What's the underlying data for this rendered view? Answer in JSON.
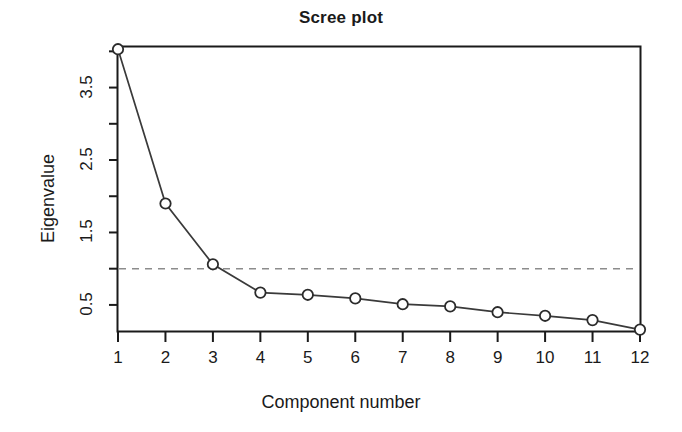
{
  "chart_data": {
    "type": "line",
    "title": "Scree plot",
    "xlabel": "Component number",
    "ylabel": "Eigenvalue",
    "categories": [
      1,
      2,
      3,
      4,
      5,
      6,
      7,
      8,
      9,
      10,
      11,
      12
    ],
    "x_tick_labels": [
      "1",
      "2",
      "3",
      "4",
      "5",
      "6",
      "7",
      "8",
      "9",
      "10",
      "11",
      "12"
    ],
    "values": [
      4.03,
      1.9,
      1.06,
      0.67,
      0.64,
      0.59,
      0.51,
      0.48,
      0.4,
      0.35,
      0.29,
      0.16
    ],
    "series": [
      {
        "name": "Eigenvalue",
        "values": [
          4.03,
          1.9,
          1.06,
          0.67,
          0.64,
          0.59,
          0.51,
          0.48,
          0.4,
          0.35,
          0.29,
          0.16
        ]
      }
    ],
    "y_tick_labels": [
      "0.5",
      "1.5",
      "2.5",
      "3.5"
    ],
    "y_tick_values": [
      0.5,
      1.5,
      2.5,
      3.5
    ],
    "y_minor_tick_values": [
      1.0,
      2.0,
      3.0,
      4.0
    ],
    "ylim": [
      0.14,
      4.06
    ],
    "xlim": [
      1,
      12
    ],
    "grid": false,
    "legend": "none",
    "marker": "open-circle",
    "reference_line": {
      "label": "eigenvalue-1-cutoff",
      "orientation": "horizontal",
      "value": 1.0,
      "style": "dashed",
      "color": "#8c8c8c"
    },
    "colors": {
      "line": "#3a3a3a",
      "marker": "#2b2b2b",
      "axis": "#1a1a1a",
      "text": "#1a1a1a",
      "background": "#ffffff",
      "reference_line": "#8c8c8c"
    }
  }
}
